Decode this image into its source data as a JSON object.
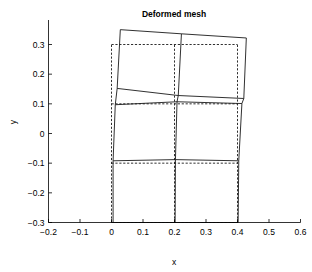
{
  "chart_data": {
    "type": "line",
    "title": "Deformed mesh",
    "xlabel": "x",
    "ylabel": "y",
    "xlim": [
      -0.2,
      0.6
    ],
    "ylim": [
      -0.3,
      0.35
    ],
    "xticks": [
      -0.2,
      -0.1,
      0,
      0.1,
      0.2,
      0.3,
      0.4,
      0.5,
      0.6
    ],
    "xtick_labels": [
      "−0.2",
      "−0.1",
      "0",
      "0.1",
      "0.2",
      "0.3",
      "0.4",
      "0.5",
      "0.6"
    ],
    "yticks": [
      -0.3,
      -0.2,
      -0.1,
      0,
      0.1,
      0.2,
      0.3
    ],
    "ytick_labels": [
      "−0.3",
      "−0.2",
      "−0.1",
      "0",
      "0.1",
      "0.2",
      "0.3"
    ],
    "grid": false,
    "legend": null,
    "box": false,
    "series": [
      {
        "name": "original mesh",
        "style": "dashed",
        "color": "#1a1a1a",
        "description": "Undeformed rectangular grid, 2 columns by 3 rows of elements",
        "nodes": [
          [
            0.0,
            -0.3
          ],
          [
            0.2,
            -0.3
          ],
          [
            0.4,
            -0.3
          ],
          [
            0.0,
            -0.1
          ],
          [
            0.2,
            -0.1
          ],
          [
            0.4,
            -0.1
          ],
          [
            0.0,
            0.1
          ],
          [
            0.2,
            0.1
          ],
          [
            0.4,
            0.1
          ],
          [
            0.0,
            0.3
          ],
          [
            0.2,
            0.3
          ],
          [
            0.4,
            0.3
          ]
        ],
        "polylines": [
          [
            [
              0.0,
              -0.3
            ],
            [
              0.0,
              0.3
            ]
          ],
          [
            [
              0.2,
              -0.3
            ],
            [
              0.2,
              0.3
            ]
          ],
          [
            [
              0.4,
              -0.3
            ],
            [
              0.4,
              0.3
            ]
          ],
          [
            [
              0.0,
              -0.3
            ],
            [
              0.4,
              -0.3
            ]
          ],
          [
            [
              0.0,
              -0.1
            ],
            [
              0.4,
              -0.1
            ]
          ],
          [
            [
              0.0,
              0.1
            ],
            [
              0.4,
              0.1
            ]
          ],
          [
            [
              0.0,
              0.3
            ],
            [
              0.4,
              0.3
            ]
          ]
        ]
      },
      {
        "name": "deformed mesh",
        "style": "solid",
        "color": "#1a1a1a",
        "description": "Shear-deformed grid; base fixed at y=-0.3, upper rows translated right and rotated",
        "nodes": [
          [
            0.005,
            -0.3
          ],
          [
            0.202,
            -0.3
          ],
          [
            0.402,
            -0.3
          ],
          [
            0.005,
            -0.092
          ],
          [
            0.203,
            -0.088
          ],
          [
            0.404,
            -0.092
          ],
          [
            0.012,
            0.097
          ],
          [
            0.208,
            0.107
          ],
          [
            0.414,
            0.101
          ],
          [
            0.018,
            0.152
          ],
          [
            0.212,
            0.128
          ],
          [
            0.42,
            0.118
          ],
          [
            0.028,
            0.35
          ],
          [
            0.222,
            0.336
          ],
          [
            0.428,
            0.322
          ]
        ],
        "polylines": [
          [
            [
              0.005,
              -0.3
            ],
            [
              0.005,
              -0.092
            ],
            [
              0.012,
              0.097
            ],
            [
              0.018,
              0.152
            ],
            [
              0.028,
              0.35
            ]
          ],
          [
            [
              0.202,
              -0.3
            ],
            [
              0.203,
              -0.088
            ],
            [
              0.208,
              0.107
            ],
            [
              0.212,
              0.128
            ],
            [
              0.222,
              0.336
            ]
          ],
          [
            [
              0.402,
              -0.3
            ],
            [
              0.404,
              -0.092
            ],
            [
              0.414,
              0.101
            ],
            [
              0.42,
              0.118
            ],
            [
              0.428,
              0.322
            ]
          ],
          [
            [
              0.005,
              -0.3
            ],
            [
              0.202,
              -0.3
            ],
            [
              0.402,
              -0.3
            ]
          ],
          [
            [
              0.005,
              -0.092
            ],
            [
              0.203,
              -0.088
            ],
            [
              0.404,
              -0.092
            ]
          ],
          [
            [
              0.012,
              0.097
            ],
            [
              0.208,
              0.107
            ],
            [
              0.414,
              0.101
            ]
          ],
          [
            [
              0.018,
              0.152
            ],
            [
              0.212,
              0.128
            ],
            [
              0.42,
              0.118
            ]
          ],
          [
            [
              0.028,
              0.35
            ],
            [
              0.222,
              0.336
            ],
            [
              0.428,
              0.322
            ]
          ]
        ]
      }
    ]
  }
}
